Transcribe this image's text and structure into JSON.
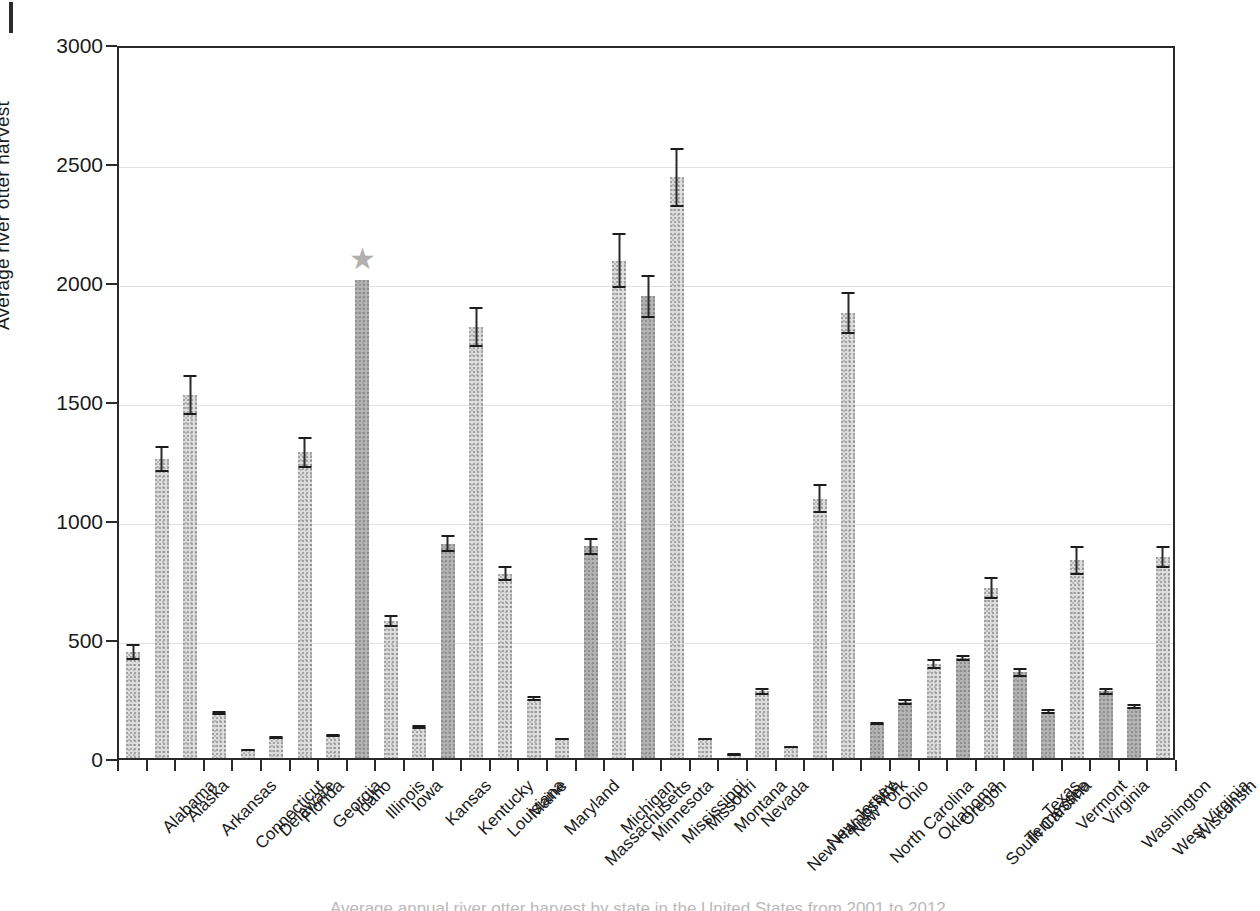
{
  "figure": {
    "star_marker": "★",
    "star_state": "Illinois",
    "caption_clipped": "Average annual river otter harvest by state in the United States from 2001 to 2012"
  },
  "chart_data": {
    "type": "bar",
    "title": "",
    "xlabel": "",
    "ylabel": "Average river otter harvest",
    "ylim": [
      0,
      3000
    ],
    "yticks": [
      0,
      500,
      1000,
      1500,
      2000,
      2500,
      3000
    ],
    "ytick_labels": [
      "0",
      "500",
      "1000",
      "1500",
      "2000",
      "2500",
      "3000"
    ],
    "grid": true,
    "legend": "none",
    "error_bars": "standard error",
    "categories": [
      "Alabama",
      "Alaska",
      "Arkansas",
      "Connecticut",
      "Delaware",
      "Florida",
      "Georgia",
      "Idaho",
      "Illinois",
      "Iowa",
      "Kansas",
      "Kentucky",
      "Louisiana",
      "Maine",
      "Maryland",
      "Massachusetts",
      "Michigan",
      "Minnesota",
      "Mississippi",
      "Missouri",
      "Montana",
      "Nevada",
      "New Hampshire",
      "New Jersey",
      "New York",
      "North Carolina",
      "Ohio",
      "Oklahoma",
      "Oregon",
      "South Carolina",
      "Tennessee",
      "Texas",
      "Vermont",
      "Virginia",
      "Washington",
      "West Virginia",
      "Wisconsin"
    ],
    "values": [
      445,
      1255,
      1525,
      190,
      35,
      85,
      1285,
      95,
      2010,
      575,
      130,
      900,
      1810,
      775,
      250,
      80,
      890,
      2090,
      1940,
      2440,
      80,
      15,
      280,
      45,
      1090,
      1870,
      145,
      235,
      395,
      420,
      715,
      360,
      195,
      830,
      280,
      215,
      845
    ],
    "errors": [
      35,
      55,
      85,
      8,
      5,
      6,
      65,
      6,
      0,
      25,
      8,
      35,
      85,
      30,
      12,
      6,
      35,
      115,
      90,
      125,
      6,
      3,
      16,
      4,
      60,
      90,
      8,
      12,
      22,
      14,
      45,
      18,
      9,
      60,
      14,
      11,
      45
    ],
    "bar_shades": [
      "light",
      "light",
      "light",
      "light",
      "light",
      "light",
      "light",
      "light",
      "dark",
      "light",
      "light",
      "dark",
      "light",
      "light",
      "light",
      "light",
      "dark",
      "light",
      "dark",
      "light",
      "light",
      "light",
      "light",
      "light",
      "light",
      "light",
      "dark",
      "dark",
      "light",
      "dark",
      "light",
      "dark",
      "dark",
      "light",
      "dark",
      "dark",
      "light"
    ]
  }
}
